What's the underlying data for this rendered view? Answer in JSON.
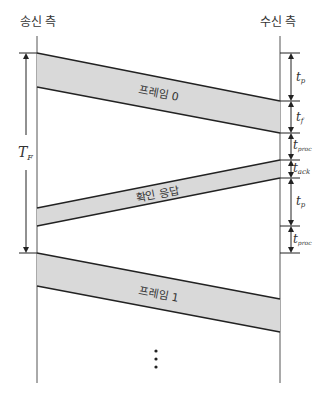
{
  "diagram": {
    "sender_label": "송신 측",
    "receiver_label": "수신 측",
    "total_time_label": "T",
    "total_time_sub": "F",
    "frames": [
      {
        "label": "프레임 0"
      },
      {
        "label": "확인 응답"
      },
      {
        "label": "프레임 1"
      }
    ],
    "continuation": "⋮",
    "intervals": [
      {
        "main": "t",
        "sub": "p"
      },
      {
        "main": "t",
        "sub": "f"
      },
      {
        "main": "t",
        "sub": "proc"
      },
      {
        "main": "t",
        "sub": "ack"
      },
      {
        "main": "t",
        "sub": "p"
      },
      {
        "main": "t",
        "sub": "proc"
      }
    ],
    "colors": {
      "band_fill": "#d9d9d9",
      "line": "#222222"
    }
  }
}
